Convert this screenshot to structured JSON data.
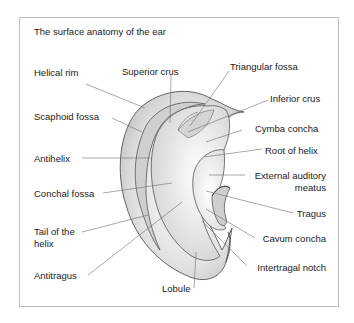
{
  "title": "The surface anatomy of the ear",
  "colors": {
    "frame": "#bdbdbd",
    "ear_fill_light": "#f2f2f2",
    "ear_fill_mid": "#d9d9d9",
    "ear_fill_dark": "#bfbfbf",
    "outline": "#555555",
    "leader": "#6e6e6e"
  },
  "labels": {
    "helical_rim": "Helical rim",
    "scaphoid_fossa": "Scaphoid fossa",
    "antihelix": "Antihelix",
    "conchal_fossa": "Conchal fossa",
    "tail_of_helix_line1": "Tail of the",
    "tail_of_helix_line2": "helix",
    "antitragus": "Antitragus",
    "lobule": "Lobule",
    "superior_crus": "Superior crus",
    "triangular_fossa": "Triangular fossa",
    "inferior_crus": "Inferior crus",
    "cymba_concha": "Cymba concha",
    "root_of_helix": "Root of helix",
    "external_auditory_meatus_line1": "External auditory",
    "external_auditory_meatus_line2": "meatus",
    "tragus": "Tragus",
    "cavum_concha": "Cavum concha",
    "intertragal_notch": "Intertragal notch"
  }
}
